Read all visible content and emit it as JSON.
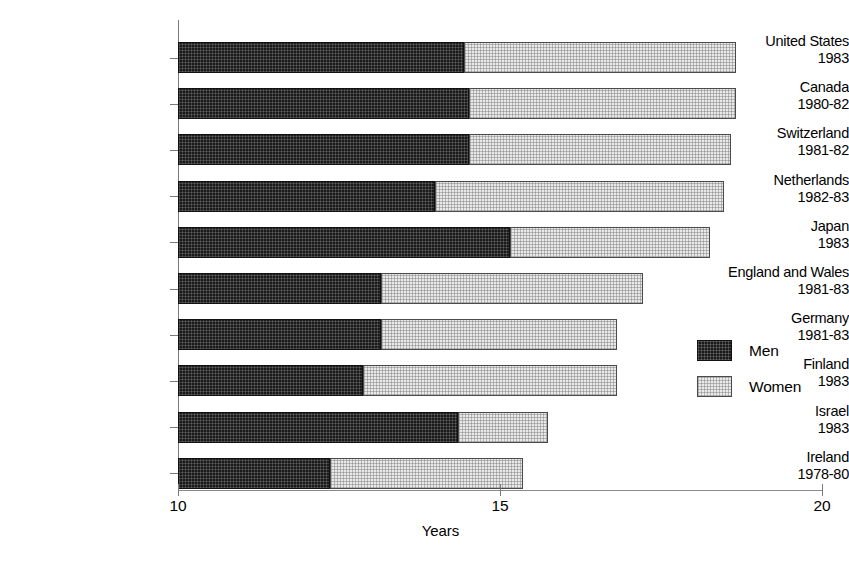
{
  "chart_data": {
    "type": "bar",
    "subtype": "stacked-horizontal",
    "title": "",
    "xlabel": "Years",
    "ylabel": "",
    "xlim": [
      10,
      20
    ],
    "xticks": [
      10,
      15,
      20
    ],
    "xticklabels": [
      "10",
      "15",
      "20"
    ],
    "grid": false,
    "legend_position": "right-middle",
    "categories": [
      "United States",
      "Canada",
      "Switzerland",
      "Netherlands",
      "Japan",
      "England and Wales",
      "Germany",
      "Finland",
      "Israel",
      "Ireland"
    ],
    "category_years": [
      "1983",
      "1980-82",
      "1981-82",
      "1982-83",
      "1983",
      "1981-83",
      "1981-83",
      "1983",
      "1983",
      "1978-80"
    ],
    "series": [
      {
        "name": "Men",
        "color": "#1a1a1a",
        "values": [
          14.44,
          14.52,
          14.52,
          13.99,
          15.16,
          13.15,
          13.15,
          12.87,
          14.35,
          12.36
        ]
      },
      {
        "name": "Women",
        "color": "#e9e9e9",
        "values": [
          18.66,
          18.66,
          18.59,
          18.48,
          18.26,
          17.22,
          16.81,
          16.81,
          15.75,
          15.36
        ]
      }
    ],
    "note": "Men values are the stacked segment end positions; Women values are total bar end positions on the Years axis."
  },
  "legend": {
    "items": [
      {
        "label": "Men",
        "swatch": "men"
      },
      {
        "label": "Women",
        "swatch": "women"
      }
    ]
  },
  "axis": {
    "x_title": "Years"
  }
}
